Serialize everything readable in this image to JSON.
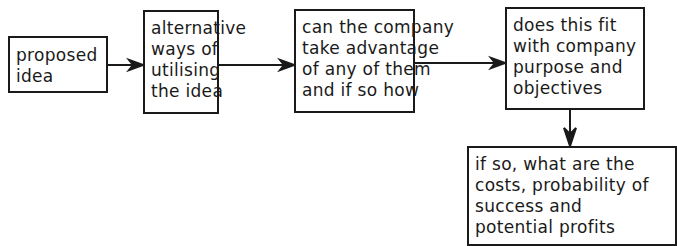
{
  "diagram": {
    "type": "flowchart",
    "nodes": [
      {
        "id": "proposed-idea",
        "lines": [
          "proposed",
          "idea"
        ]
      },
      {
        "id": "alternative-ways",
        "lines": [
          "alternative",
          "ways of",
          "utilising",
          "the idea"
        ]
      },
      {
        "id": "take-advantage",
        "lines": [
          "can the company",
          "take advantage",
          "of any of them",
          "and if so how"
        ]
      },
      {
        "id": "fit-purpose",
        "lines": [
          "does this fit",
          "with company",
          "purpose and",
          "objectives"
        ]
      },
      {
        "id": "costs-profits",
        "lines": [
          "if so, what are the",
          "costs, probability of",
          "success and",
          "potential profits"
        ]
      }
    ],
    "edges": [
      {
        "from": "proposed-idea",
        "to": "alternative-ways",
        "direction": "right"
      },
      {
        "from": "alternative-ways",
        "to": "take-advantage",
        "direction": "right"
      },
      {
        "from": "take-advantage",
        "to": "fit-purpose",
        "direction": "right"
      },
      {
        "from": "fit-purpose",
        "to": "costs-profits",
        "direction": "down"
      }
    ]
  }
}
